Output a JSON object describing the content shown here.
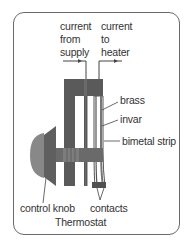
{
  "diagram": {
    "title": "Thermostat",
    "labels": {
      "current_from_supply": [
        "current",
        "from",
        "supply"
      ],
      "current_to_heater": [
        "current",
        "to",
        "heater"
      ],
      "brass": "brass",
      "invar": "invar",
      "bimetal_strip": "bimetal strip",
      "control_knob": "control knob",
      "contacts": "contacts"
    },
    "colors": {
      "frame": "#6a6a6a",
      "body_dark": "#5a5a5a",
      "knob": "#8a8a8a",
      "strip_edge": "#555555",
      "text": "#333333"
    }
  }
}
